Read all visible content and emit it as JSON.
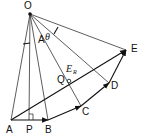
{
  "diagram": {
    "type": "vector-geometry",
    "points": {
      "O": {
        "label": "O",
        "x": 30,
        "y": 14
      },
      "A": {
        "label": "A",
        "x": 11,
        "y": 120
      },
      "P": {
        "label": "P",
        "x": 29,
        "y": 120
      },
      "B": {
        "label": "B",
        "x": 48,
        "y": 120
      },
      "C": {
        "label": "C",
        "x": 81,
        "y": 106
      },
      "D": {
        "label": "D",
        "x": 109,
        "y": 83
      },
      "E": {
        "label": "E",
        "x": 126,
        "y": 50
      },
      "Q": {
        "label": "Q",
        "x": 69,
        "y": 81
      }
    },
    "labels": {
      "O": "O",
      "A": "A",
      "P": "P",
      "B": "B",
      "C": "C",
      "D": "D",
      "E": "E",
      "Q": "Q",
      "angle_A": "A",
      "theta": "θ",
      "resultant_main": "E",
      "resultant_sub": "R"
    },
    "edges": [
      {
        "from": "O",
        "to": "A",
        "style": "thin"
      },
      {
        "from": "O",
        "to": "P",
        "style": "thin"
      },
      {
        "from": "O",
        "to": "B",
        "style": "thin"
      },
      {
        "from": "O",
        "to": "C",
        "style": "thin"
      },
      {
        "from": "O",
        "to": "D",
        "style": "thin"
      },
      {
        "from": "O",
        "to": "E",
        "style": "thin"
      },
      {
        "from": "A",
        "to": "B",
        "style": "arrow"
      },
      {
        "from": "B",
        "to": "C",
        "style": "arrow"
      },
      {
        "from": "C",
        "to": "D",
        "style": "arrow"
      },
      {
        "from": "D",
        "to": "E",
        "style": "arrow"
      },
      {
        "from": "A",
        "to": "E",
        "style": "arrow",
        "label": "E_R"
      }
    ],
    "annotations": [
      "right-angle at P",
      "angle A between OA and OP",
      "angle θ between OD and OE",
      "small circle at Q"
    ]
  }
}
